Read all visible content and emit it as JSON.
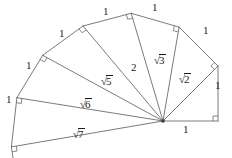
{
  "figure": {
    "name": "spiral-of-theodorus",
    "stroke_color": "#6b6b6b",
    "text_color": "#1b1b1b",
    "background": "#ffffff",
    "hub": {
      "x": 163,
      "y": 121
    },
    "unit_px": 55,
    "vertices": [
      {
        "i": 0,
        "x": 218,
        "y": 121
      },
      {
        "i": 1,
        "x": 218,
        "y": 66
      },
      {
        "i": 2,
        "x": 179.1,
        "y": 27.1
      },
      {
        "i": 3,
        "x": 131.2,
        "y": 13.3
      },
      {
        "i": 4,
        "x": 83.0,
        "y": 26.0
      },
      {
        "i": 5,
        "x": 42.7,
        "y": 55.3
      },
      {
        "i": 6,
        "x": 16.9,
        "y": 97.7
      },
      {
        "i": 7,
        "x": 11.4,
        "y": 146.9
      }
    ],
    "radii_labels": [
      {
        "text": "1",
        "kind": "plain",
        "x": 183,
        "y": 124
      },
      {
        "text": "2",
        "kind": "root",
        "arg": "2",
        "x": 178,
        "y": 73
      },
      {
        "text": "3",
        "kind": "root",
        "arg": "3",
        "x": 153,
        "y": 54
      },
      {
        "text": "4",
        "kind": "plain",
        "label": "2",
        "x": 131,
        "y": 62
      },
      {
        "text": "5",
        "kind": "root",
        "arg": "5",
        "x": 100,
        "y": 75
      },
      {
        "text": "6",
        "kind": "root",
        "arg": "6",
        "x": 79,
        "y": 98
      },
      {
        "text": "7",
        "kind": "root",
        "arg": "7",
        "x": 72,
        "y": 128
      }
    ],
    "unit_labels": [
      {
        "text": "1",
        "x": 215,
        "y": 80
      },
      {
        "text": "1",
        "x": 203,
        "y": 25
      },
      {
        "text": "1",
        "x": 152,
        "y": 2
      },
      {
        "text": "1",
        "x": 103,
        "y": 6
      },
      {
        "text": "1",
        "x": 59,
        "y": 28
      },
      {
        "text": "1",
        "x": 26,
        "y": 60
      },
      {
        "text": "1",
        "x": 6,
        "y": 94
      }
    ],
    "right_angle_markers": [
      {
        "at": 0,
        "size": 5
      },
      {
        "at": 1,
        "size": 5
      },
      {
        "at": 2,
        "size": 5
      },
      {
        "at": 3,
        "size": 5
      },
      {
        "at": 4,
        "size": 5
      },
      {
        "at": 5,
        "size": 5
      },
      {
        "at": 6,
        "size": 5
      },
      {
        "at": 7,
        "size": 5
      }
    ],
    "tail_segment": {
      "x1": 11.4,
      "y1": 146.9,
      "x2": 13.0,
      "y2": 158.0
    },
    "hub_dot": {
      "r": 1.8
    }
  },
  "labels_text": {
    "one": "1",
    "two": "2",
    "sqrt2": "2",
    "sqrt3": "3",
    "sqrt5": "5",
    "sqrt6": "6",
    "sqrt7": "7",
    "radical": "√"
  },
  "chart_data": {
    "type": "diagram",
    "segments": [
      {
        "from": "hub",
        "to": "v0",
        "length_label": "1"
      },
      {
        "from": "hub",
        "to": "v1",
        "length_label": "√2"
      },
      {
        "from": "hub",
        "to": "v2",
        "length_label": "√3"
      },
      {
        "from": "hub",
        "to": "v3",
        "length_label": "2"
      },
      {
        "from": "hub",
        "to": "v4",
        "length_label": "√5"
      },
      {
        "from": "hub",
        "to": "v5",
        "length_label": "√6"
      },
      {
        "from": "hub",
        "to": "v6",
        "length_label": "√7"
      }
    ],
    "outer_legs": [
      {
        "from": "v0",
        "to": "v1",
        "length_label": "1"
      },
      {
        "from": "v1",
        "to": "v2",
        "length_label": "1"
      },
      {
        "from": "v2",
        "to": "v3",
        "length_label": "1"
      },
      {
        "from": "v3",
        "to": "v4",
        "length_label": "1"
      },
      {
        "from": "v4",
        "to": "v5",
        "length_label": "1"
      },
      {
        "from": "v5",
        "to": "v6",
        "length_label": "1"
      },
      {
        "from": "v6",
        "to": "v7",
        "length_label": "1"
      }
    ]
  }
}
